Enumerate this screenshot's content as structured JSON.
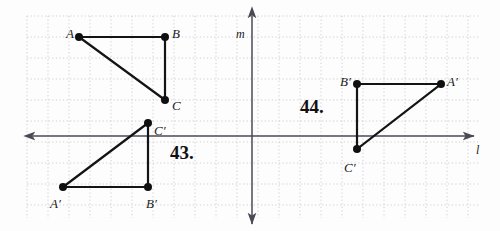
{
  "figure": {
    "background_color": "#fdfdfd",
    "width": 500,
    "height": 231
  },
  "grid": {
    "style": "dotted",
    "color": "#c9c9d2",
    "spacing_px": 21,
    "left": 27,
    "top": 16,
    "right": 480,
    "bottom": 218
  },
  "axes": {
    "horizontal": {
      "label": "l",
      "name": "line-l",
      "y": 136,
      "x_start": 33,
      "x_end": 474,
      "color": "#4a4a55",
      "label_x": 476,
      "label_y": 144,
      "arrows": "both"
    },
    "vertical": {
      "label": "m",
      "name": "line-m",
      "x": 252,
      "y_start": 16,
      "y_end": 224,
      "color": "#4a4a55",
      "label_x": 236,
      "label_y": 28,
      "arrows": "both"
    }
  },
  "problem_43": {
    "number": "43.",
    "number_x": 170,
    "number_y": 143,
    "pre_image": {
      "name": "triangle-ABC",
      "vertices": [
        {
          "label": "A",
          "x": 79,
          "y": 37,
          "label_x": 66,
          "label_y": 27
        },
        {
          "label": "B",
          "x": 165,
          "y": 37,
          "label_x": 172,
          "label_y": 27
        },
        {
          "label": "C",
          "x": 165,
          "y": 100,
          "label_x": 172,
          "label_y": 99
        }
      ]
    },
    "image": {
      "name": "triangle-A-prime-B-prime-C-prime",
      "vertices": [
        {
          "label": "C′",
          "x": 148,
          "y": 123,
          "label_x": 154,
          "label_y": 124
        },
        {
          "label": "A′",
          "x": 63,
          "y": 187,
          "label_x": 50,
          "label_y": 197
        },
        {
          "label": "B′",
          "x": 148,
          "y": 187,
          "label_x": 146,
          "label_y": 197
        }
      ]
    }
  },
  "problem_44": {
    "number": "44.",
    "number_x": 300,
    "number_y": 97,
    "image": {
      "name": "triangle-A-prime-B-prime-C-prime",
      "vertices": [
        {
          "label": "B′",
          "x": 357,
          "y": 84,
          "label_x": 340,
          "label_y": 75
        },
        {
          "label": "A′",
          "x": 441,
          "y": 84,
          "label_x": 447,
          "label_y": 75
        },
        {
          "label": "C′",
          "x": 357,
          "y": 149,
          "label_x": 344,
          "label_y": 161
        }
      ]
    }
  },
  "style": {
    "segment_color": "#141414",
    "segment_width": 2.2,
    "vertex_color": "#101010",
    "vertex_radius": 4
  }
}
